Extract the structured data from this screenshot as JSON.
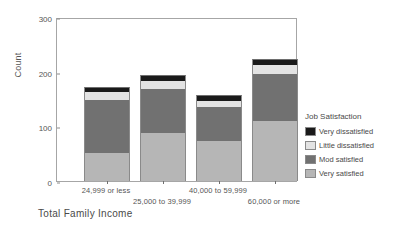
{
  "chart_data": {
    "type": "bar",
    "subtype": "stacked",
    "title": "",
    "xlabel": "Total Family Income",
    "ylabel": "Count",
    "ylim": [
      0,
      300
    ],
    "yticks": [
      "0",
      "100",
      "200",
      "300"
    ],
    "grid": false,
    "legend_position": "right",
    "legend_title": "Job Satisfaction",
    "categories": [
      "24,999 or less",
      "25,000 to 39,999",
      "40,000 to 59,999",
      "60,000 or more"
    ],
    "series": [
      {
        "name": "Very satisfied",
        "color": "#b6b6b6",
        "values": [
          51,
          88,
          73,
          110
        ]
      },
      {
        "name": "Mod satisfied",
        "color": "#717171",
        "values": [
          97,
          80,
          62,
          86
        ]
      },
      {
        "name": "Little dissatisfied",
        "color": "#e3e3e3",
        "values": [
          15,
          15,
          11,
          16
        ]
      },
      {
        "name": "Very dissatisfied",
        "color": "#1a1a1a",
        "values": [
          9,
          11,
          11,
          11
        ]
      }
    ],
    "totals": [
      172,
      194,
      157,
      223
    ]
  },
  "legend": {
    "title": "Job Satisfaction",
    "items": [
      {
        "label": "Very dissatisfied",
        "color": "#1a1a1a"
      },
      {
        "label": "Little dissatisfied",
        "color": "#e3e3e3"
      },
      {
        "label": "Mod satisfied",
        "color": "#717171"
      },
      {
        "label": "Very satisfied",
        "color": "#b6b6b6"
      }
    ]
  },
  "axes": {
    "y_title": "Count",
    "y_ticks": [
      "300",
      "200",
      "100",
      "0"
    ],
    "x_title": "Total Family Income",
    "x_ticks": [
      "24,999 or less",
      "25,000 to 39,999",
      "40,000 to 59,999",
      "60,000 or more"
    ]
  }
}
